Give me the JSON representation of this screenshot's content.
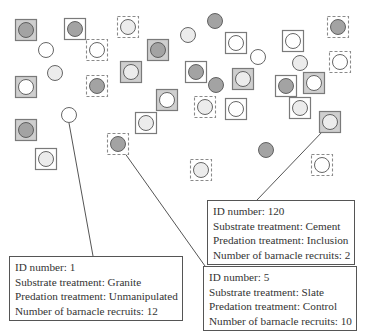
{
  "colors": {
    "background": "#ffffff",
    "square_fill_gray": "#cfcfcf",
    "square_fill_white": "#ffffff",
    "square_stroke": "#7a7a7a",
    "dashed_stroke": "#8a8a8a",
    "circle_dark": "#a3a3a3",
    "circle_light": "#ececec",
    "circle_white": "#ffffff",
    "circle_stroke": "#555555",
    "leader_line": "#555555"
  },
  "legend_semantics": {
    "square_solid_gray": "Substrate treatment (shaded plate)",
    "square_solid_white": "Substrate treatment (white plate)",
    "square_dashed": "Cage / predation treatment",
    "circle_fill": "Barnacle recruitment level"
  },
  "units": [
    {
      "x": 26,
      "y": 30,
      "frame": "gray",
      "circle": "dark"
    },
    {
      "x": 75,
      "y": 29,
      "frame": "white",
      "circle": "dark"
    },
    {
      "x": 46,
      "y": 50,
      "frame": "none",
      "circle": "white"
    },
    {
      "x": 97,
      "y": 50,
      "frame": "dashed",
      "circle": "white"
    },
    {
      "x": 128,
      "y": 27,
      "frame": "dashed",
      "circle": "light"
    },
    {
      "x": 158,
      "y": 50,
      "frame": "gray",
      "circle": "dark"
    },
    {
      "x": 188,
      "y": 35,
      "frame": "none",
      "circle": "light"
    },
    {
      "x": 215,
      "y": 21,
      "frame": "none",
      "circle": "dark"
    },
    {
      "x": 236,
      "y": 43,
      "frame": "white",
      "circle": "white"
    },
    {
      "x": 258,
      "y": 57,
      "frame": "none",
      "circle": "white"
    },
    {
      "x": 293,
      "y": 41,
      "frame": "white",
      "circle": "white"
    },
    {
      "x": 338,
      "y": 27,
      "frame": "dashed",
      "circle": "dark"
    },
    {
      "x": 340,
      "y": 62,
      "frame": "dashed",
      "circle": "white"
    },
    {
      "x": 300,
      "y": 63,
      "frame": "none",
      "circle": "light"
    },
    {
      "x": 55,
      "y": 73,
      "frame": "none",
      "circle": "light"
    },
    {
      "x": 26,
      "y": 87,
      "frame": "gray",
      "circle": "white"
    },
    {
      "x": 97,
      "y": 86,
      "frame": "dashed",
      "circle": "dark"
    },
    {
      "x": 131,
      "y": 72,
      "frame": "gray",
      "circle": "light"
    },
    {
      "x": 196,
      "y": 72,
      "frame": "white",
      "circle": "dark"
    },
    {
      "x": 216,
      "y": 85,
      "frame": "none",
      "circle": "dark"
    },
    {
      "x": 243,
      "y": 79,
      "frame": "gray",
      "circle": "light"
    },
    {
      "x": 195,
      "y": 75,
      "frame": "none",
      "circle": "none"
    },
    {
      "x": 286,
      "y": 86,
      "frame": "white",
      "circle": "dark"
    },
    {
      "x": 314,
      "y": 83,
      "frame": "gray",
      "circle": "white"
    },
    {
      "x": 167,
      "y": 100,
      "frame": "gray",
      "circle": "white"
    },
    {
      "x": 205,
      "y": 107,
      "frame": "dashed",
      "circle": "light"
    },
    {
      "x": 236,
      "y": 109,
      "frame": "white",
      "circle": "white"
    },
    {
      "x": 300,
      "y": 108,
      "frame": "white",
      "circle": "light"
    },
    {
      "x": 330,
      "y": 122,
      "frame": "gray",
      "circle": "light"
    },
    {
      "x": 146,
      "y": 123,
      "frame": "white",
      "circle": "light"
    },
    {
      "x": 69,
      "y": 115,
      "frame": "none",
      "circle": "white"
    },
    {
      "x": 26,
      "y": 130,
      "frame": "gray",
      "circle": "dark"
    },
    {
      "x": 46,
      "y": 159,
      "frame": "white",
      "circle": "light"
    },
    {
      "x": 118,
      "y": 144,
      "frame": "dashed",
      "circle": "dark"
    },
    {
      "x": 266,
      "y": 150,
      "frame": "none",
      "circle": "dark"
    },
    {
      "x": 322,
      "y": 165,
      "frame": "dashed",
      "circle": "white"
    },
    {
      "x": 201,
      "y": 170,
      "frame": "dashed",
      "circle": "light"
    }
  ],
  "leader_lines": [
    {
      "x1": 69,
      "y1": 123,
      "x2": 93,
      "y2": 256
    },
    {
      "x1": 124,
      "y1": 152,
      "x2": 205,
      "y2": 266
    },
    {
      "x1": 323,
      "y1": 131,
      "x2": 257,
      "y2": 200
    }
  ],
  "callouts": [
    {
      "id": "callout-1",
      "left": 9,
      "top": 256,
      "lines": [
        "ID number: 1",
        "Substrate treatment: Granite",
        "Predation treatment: Unmanipulated",
        "Number of barnacle recruits: 12"
      ]
    },
    {
      "id": "callout-120",
      "left": 207,
      "top": 200,
      "lines": [
        "ID number: 120",
        "Substrate treatment: Cement",
        "Predation treatment: Inclusion",
        "Number of barnacle recruits: 2"
      ]
    },
    {
      "id": "callout-5",
      "left": 203,
      "top": 266,
      "lines": [
        "ID number: 5",
        "Substrate treatment: Slate",
        "Predation treatment: Control",
        "Number of barnacle recruits: 10"
      ]
    }
  ]
}
